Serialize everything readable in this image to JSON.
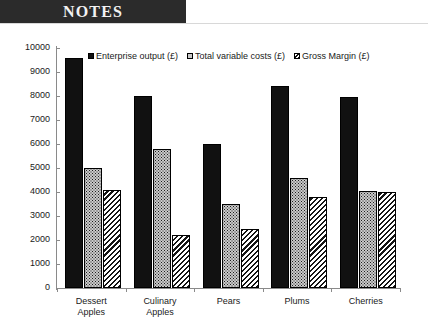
{
  "banner": {
    "title": "NOTES"
  },
  "chart_data": {
    "type": "bar",
    "title": "",
    "xlabel": "",
    "ylabel": "",
    "ylim": [
      0,
      10000
    ],
    "ytick_step": 1000,
    "yticks": [
      "10000",
      "9000",
      "8000",
      "7000",
      "6000",
      "5000",
      "4000",
      "3000",
      "2000",
      "1000",
      "0"
    ],
    "grid": false,
    "legend_position": "top",
    "categories": [
      "Dessert Apples",
      "Culinary Apples",
      "Pears",
      "Plums",
      "Cherries"
    ],
    "category_lines": [
      [
        "Dessert",
        "Apples"
      ],
      [
        "Culinary",
        "Apples"
      ],
      [
        "Pears"
      ],
      [
        "Plums"
      ],
      [
        "Cherries"
      ]
    ],
    "series": [
      {
        "name": "Enterprise output (£)",
        "pattern": "solid-black",
        "values": [
          9600,
          8000,
          6000,
          8400,
          7950
        ]
      },
      {
        "name": "Total variable costs (£)",
        "pattern": "stipple-gray",
        "values": [
          5000,
          5800,
          3500,
          4600,
          4050
        ]
      },
      {
        "name": "Gross Margin (£)",
        "pattern": "diagonal-hatch",
        "values": [
          4100,
          2200,
          2450,
          3800,
          4000
        ]
      }
    ]
  }
}
